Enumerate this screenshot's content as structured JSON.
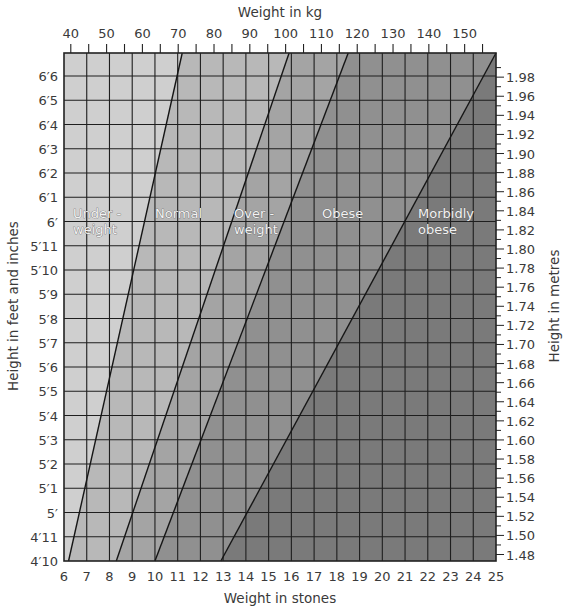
{
  "chart_data": {
    "type": "area",
    "title": "",
    "x_top": {
      "label": "Weight in kg",
      "ticks": [
        40,
        50,
        60,
        70,
        80,
        90,
        100,
        110,
        120,
        130,
        140,
        150
      ],
      "range": [
        39.6,
        158.8
      ]
    },
    "x_bottom": {
      "label": "Weight in stones",
      "ticks": [
        6,
        7,
        8,
        9,
        10,
        11,
        12,
        13,
        14,
        15,
        16,
        17,
        18,
        19,
        20,
        21,
        22,
        23,
        24,
        25
      ],
      "range": [
        6,
        25
      ]
    },
    "y_left": {
      "label": "Height in feet and inches",
      "ticks": [
        "4′10",
        "4′11",
        "5′",
        "5′1",
        "5′2",
        "5′3",
        "5′4",
        "5′5",
        "5′6",
        "5′7",
        "5′8",
        "5′9",
        "5′10",
        "5′11",
        "6′",
        "6′1",
        "6′2",
        "6′3",
        "6′4",
        "6′5",
        "6′6"
      ]
    },
    "y_right": {
      "label": "Height in metres",
      "ticks": [
        "1.48",
        "1.50",
        "1.52",
        "1.54",
        "1.56",
        "1.58",
        "1.60",
        "1.62",
        "1.64",
        "1.66",
        "1.68",
        "1.70",
        "1.72",
        "1.74",
        "1.76",
        "1.78",
        "1.80",
        "1.82",
        "1.84",
        "1.86",
        "1.88",
        "1.90",
        "1.92",
        "1.94",
        "1.96",
        "1.98"
      ]
    },
    "zones": [
      {
        "name": "Under-weight",
        "label_lines": [
          "Under -",
          "weight"
        ],
        "color": "#cfcfcf"
      },
      {
        "name": "Normal",
        "label_lines": [
          "Normal"
        ],
        "color": "#b8b8b8"
      },
      {
        "name": "Over-weight",
        "label_lines": [
          "Over -",
          "weight"
        ],
        "color": "#a4a4a4"
      },
      {
        "name": "Obese",
        "label_lines": [
          "Obese"
        ],
        "color": "#909090"
      },
      {
        "name": "Morbidly obese",
        "label_lines": [
          "Morbidly",
          "obese"
        ],
        "color": "#7a7a7a"
      }
    ],
    "boundaries_stones": [
      {
        "between": "Under-weight/Normal",
        "at_4ft10": 6.2,
        "at_top": 11.2
      },
      {
        "between": "Normal/Over-weight",
        "at_4ft10": 8.3,
        "at_top": 15.9
      },
      {
        "between": "Over-weight/Obese",
        "at_4ft10": 10.0,
        "at_top": 18.5
      },
      {
        "between": "Obese/Morbidly obese",
        "at_4ft10": 12.9,
        "at_top": 25.0
      }
    ],
    "grid": true,
    "legend": "none"
  }
}
